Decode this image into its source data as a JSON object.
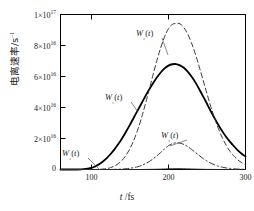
{
  "chart_data": {
    "type": "line",
    "title": "",
    "xlabel": "t /fs",
    "ylabel": "电离速率/s⁻¹",
    "xlim": [
      60,
      300
    ],
    "ylim": [
      0,
      1e+17
    ],
    "grid": false,
    "legend_position": "inline-annotations",
    "x_ticks": [
      100,
      200,
      300
    ],
    "x_tick_labels": [
      "100",
      "200",
      "300"
    ],
    "y_ticks": [
      0,
      2e+16,
      4e+16,
      6e+16,
      8e+16,
      1e+17
    ],
    "y_tick_labels": [
      "0",
      "2×10",
      "4×10",
      "6×10",
      "8×10",
      "1×10"
    ],
    "y_tick_exponents": [
      "",
      "16",
      "16",
      "16",
      "16",
      "17"
    ],
    "x": [
      60,
      70,
      80,
      90,
      100,
      105,
      110,
      115,
      120,
      125,
      130,
      135,
      140,
      145,
      150,
      155,
      160,
      165,
      170,
      175,
      180,
      185,
      190,
      195,
      200,
      205,
      210,
      215,
      220,
      225,
      230,
      235,
      240,
      245,
      250,
      255,
      260,
      265,
      270,
      275,
      280,
      285,
      290,
      295,
      300
    ],
    "series": [
      {
        "name": "W1(t)",
        "label": "W₁(t)",
        "style": "solid",
        "color": "#000000",
        "width": 1.8,
        "peak_x": 210,
        "peak_y": 6.8e+16,
        "values": [
          0,
          0,
          0,
          200000000000000.0,
          1000000000000000.0,
          2000000000000000.0,
          3400000000000000.0,
          5200000000000000.0,
          7400000000000000.0,
          1e+16,
          1.3e+16,
          1.64e+16,
          2.02e+16,
          2.44e+16,
          2.88e+16,
          3.34e+16,
          3.8e+16,
          4.26e+16,
          4.72e+16,
          5.16e+16,
          5.56e+16,
          5.94e+16,
          6.26e+16,
          6.52e+16,
          6.7e+16,
          6.79e+16,
          6.8e+16,
          6.72e+16,
          6.56e+16,
          6.32e+16,
          6e+16,
          5.62e+16,
          5.18e+16,
          4.72e+16,
          4.24e+16,
          3.76e+16,
          3.3e+16,
          2.86e+16,
          2.46e+16,
          2.1e+16,
          1.78e+16,
          1.5e+16,
          1.24e+16,
          1.02e+16,
          8400000000000000.0
        ]
      },
      {
        "name": "W2(t)",
        "label": "W₂(t)",
        "style": "dashed",
        "color": "#3a3a3a",
        "width": 1.0,
        "peak_x": 212,
        "peak_y": 9.4e+16,
        "values": [
          0,
          0,
          0,
          0,
          0,
          0,
          100000000000000.0,
          300000000000000.0,
          600000000000000.0,
          1200000000000000.0,
          2200000000000000.0,
          3800000000000000.0,
          6000000000000000.0,
          9200000000000000.0,
          1.34e+16,
          1.88e+16,
          2.54e+16,
          3.32e+16,
          4.2e+16,
          5.14e+16,
          6.1e+16,
          7.02e+16,
          7.86e+16,
          8.56e+16,
          9.08e+16,
          9.36e+16,
          9.42e+16,
          9.4e+16,
          9.16e+16,
          8.74e+16,
          8.16e+16,
          7.44e+16,
          6.62e+16,
          5.76e+16,
          4.9e+16,
          4.06e+16,
          3.3e+16,
          2.62e+16,
          2.04e+16,
          1.56e+16,
          1.16e+16,
          8600000000000000.0,
          6200000000000000.0,
          4400000000000000.0,
          3000000000000000.0
        ]
      },
      {
        "name": "W3(t)",
        "label": "W₃(t)",
        "style": "dashdot",
        "color": "#3a3a3a",
        "width": 1.0,
        "peak_x": 210,
        "peak_y": 1.7e+16,
        "values": [
          0,
          0,
          0,
          0,
          0,
          0,
          0,
          0,
          0,
          0,
          100000000000000.0,
          200000000000000.0,
          300000000000000.0,
          500000000000000.0,
          800000000000000.0,
          1200000000000000.0,
          1800000000000000.0,
          2600000000000000.0,
          3700000000000000.0,
          5100000000000000.0,
          6800000000000000.0,
          8800000000000000.0,
          1.1e+16,
          1.33e+16,
          1.53e+16,
          1.66e+16,
          1.72e+16,
          1.7e+16,
          1.62e+16,
          1.48e+16,
          1.3e+16,
          1.1e+16,
          9000000000000000.0,
          7100000000000000.0,
          5500000000000000.0,
          4100000000000000.0,
          3000000000000000.0,
          2100000000000000.0,
          1500000000000000.0,
          1000000000000000.0,
          700000000000000.0,
          400000000000000.0,
          300000000000000.0,
          200000000000000.0,
          100000000000000.0
        ]
      },
      {
        "name": "W4(t)",
        "label": "W₄(t)",
        "style": "solid-thin",
        "color": "#2a2a2a",
        "width": 0.9,
        "peak_x": 210,
        "peak_y": 600000000000000.0,
        "values": [
          0,
          0,
          0,
          0,
          0,
          0,
          0,
          0,
          0,
          0,
          0,
          0,
          0,
          0,
          0,
          0,
          0,
          0,
          50000000000000.0,
          80000000000000.0,
          120000000000000.0,
          180000000000000.0,
          260000000000000.0,
          360000000000000.0,
          460000000000000.0,
          550000000000000.0,
          600000000000000.0,
          580000000000000.0,
          520000000000000.0,
          440000000000000.0,
          350000000000000.0,
          260000000000000.0,
          190000000000000.0,
          130000000000000.0,
          90000000000000.0,
          60000000000000.0,
          40000000000000.0,
          20000000000000.0,
          10000000000000.0,
          10000000000000.0,
          0,
          0,
          0,
          0,
          0
        ]
      }
    ],
    "annotations": [
      {
        "name": "w2-label",
        "text": "W₂(t)",
        "x_px": 136,
        "y_px": 28,
        "leader_to_x": 168,
        "leader_to_y": 55
      },
      {
        "name": "w1-label",
        "text": "W₁(t)",
        "x_px": 105,
        "y_px": 92,
        "leader_to_x": 138,
        "leader_to_y": 112
      },
      {
        "name": "w3-label",
        "text": "W₃(t)",
        "x_px": 161,
        "y_px": 130,
        "leader_to_x": 170,
        "leader_to_y": 146
      },
      {
        "name": "w4-label",
        "text": "W₄(t)",
        "x_px": 62,
        "y_px": 148,
        "leader_to_x": 100,
        "leader_to_y": 170
      }
    ]
  },
  "axes": {
    "x_title_italic": "t",
    "x_title_rest": " /fs",
    "y_title": "电离速率/s",
    "y_title_sup": "−1",
    "frame_color": "#000000"
  }
}
